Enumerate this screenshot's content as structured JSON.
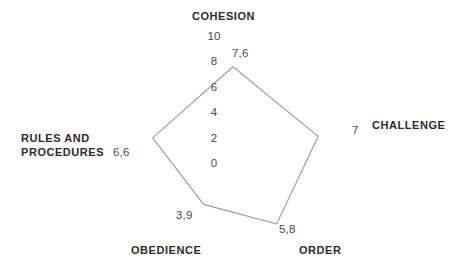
{
  "chart_data": {
    "type": "radar",
    "title": "",
    "categories": [
      "COHESION",
      "CHALLENGE",
      "ORDER",
      "OBEDIENCE",
      "RULES AND PROCEDURES"
    ],
    "values": [
      7.6,
      7,
      5.8,
      3.9,
      6.6
    ],
    "value_labels": [
      "7,6",
      "7",
      "5,8",
      "3,9",
      "6,6"
    ],
    "radial_ticks": [
      "0",
      "2",
      "4",
      "6",
      "8",
      "10"
    ],
    "radial_tick_values": [
      0,
      2,
      4,
      6,
      8,
      10
    ],
    "rlim": [
      0,
      10
    ],
    "grid": false,
    "spokes": false,
    "fill": false,
    "legend": "none",
    "series": [
      {
        "name": "",
        "values": [
          7.6,
          7,
          5.8,
          3.9,
          6.6
        ]
      }
    ],
    "line_color": "#9a9a9a",
    "label_color": "#2b2b2b",
    "tick_color": "#4a4a4a"
  },
  "axes": {
    "cohesion": {
      "title": "COHESION",
      "value": "7,6"
    },
    "challenge": {
      "title": "CHALLENGE",
      "value": "7"
    },
    "order": {
      "title": "ORDER",
      "value": "5,8"
    },
    "obedience": {
      "title": "OBEDIENCE",
      "value": "3,9"
    },
    "rules": {
      "title": "RULES AND\nPROCEDURES",
      "value": "6,6"
    }
  },
  "ticks": {
    "t0": "0",
    "t2": "2",
    "t4": "4",
    "t6": "6",
    "t8": "8",
    "t10": "10"
  }
}
